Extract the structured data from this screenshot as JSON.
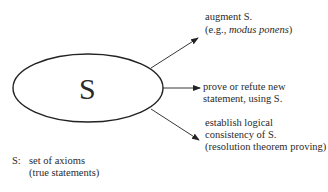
{
  "center_node": {
    "label": "S"
  },
  "branches": [
    {
      "lines": [
        "augment S.",
        "(e.g., ",
        "modus ponens",
        ")"
      ]
    },
    {
      "lines": [
        "prove or refute new",
        "statement, using S."
      ]
    },
    {
      "lines": [
        "establish logical",
        "consistency of S.",
        "(resolution theorem proving)"
      ]
    }
  ],
  "legend": {
    "key": "S:",
    "line1": "set of axioms",
    "line2": "(true statements)"
  },
  "colors": {
    "stroke": "#222222",
    "text": "#2a2a2a",
    "background": "#ffffff"
  }
}
